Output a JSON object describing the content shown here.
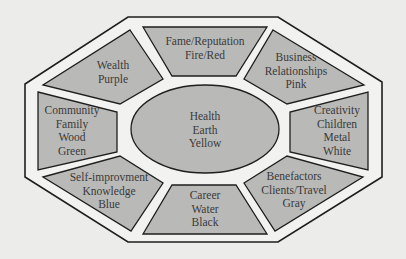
{
  "diagram": {
    "type": "bagua-map",
    "colors": {
      "background": "#ececea",
      "frame_fill": "#f2f2f0",
      "area_fill": "#b9b9b7",
      "stroke": "#1e1e1e",
      "text": "#3a3a3a"
    },
    "areas": {
      "fame": {
        "lines": [
          "Fame/Reputation",
          "Fire/Red"
        ]
      },
      "business": {
        "lines": [
          "Business",
          "Relationships",
          "Pink"
        ]
      },
      "wealth": {
        "lines": [
          "Wealth",
          "Purple"
        ]
      },
      "community": {
        "lines": [
          "Community",
          "Family",
          "Wood",
          "Green"
        ]
      },
      "health": {
        "lines": [
          "Health",
          "Earth",
          "Yellow"
        ]
      },
      "creativity": {
        "lines": [
          "Creativity",
          "Children",
          "Metal",
          "White"
        ]
      },
      "self_improvement": {
        "lines": [
          "Self-improvment",
          "Knowledge",
          "Blue"
        ]
      },
      "career": {
        "lines": [
          "Career",
          "Water",
          "Black"
        ]
      },
      "benefactors": {
        "lines": [
          "Benefactors",
          "Clients/Travel",
          "Gray"
        ]
      }
    }
  }
}
